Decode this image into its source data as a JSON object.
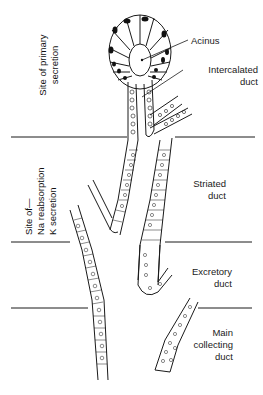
{
  "diagram": {
    "type": "histology-diagram",
    "structure_labels": [
      {
        "id": "acinus",
        "text": "Acinus"
      },
      {
        "id": "intercalated",
        "line1": "Intercalated",
        "line2": "duct"
      },
      {
        "id": "striated",
        "line1": "Striated",
        "line2": "duct"
      },
      {
        "id": "excretory",
        "line1": "Excretory",
        "line2": "duct"
      },
      {
        "id": "main",
        "line1": "Main",
        "line2": "collecting",
        "line3": "duct"
      }
    ],
    "function_labels": {
      "primary": {
        "line1": "Site of primary",
        "line2": "secretion"
      },
      "reabsorption": {
        "line1": "Site of—",
        "line2": "Na reabsorption",
        "line3": "K secretion"
      }
    },
    "colors": {
      "ink": "#1a1a1a",
      "nucleus": "#111111",
      "background": "#ffffff"
    }
  }
}
